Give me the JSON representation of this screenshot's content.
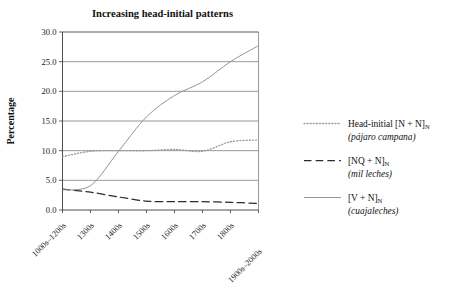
{
  "chart_data": {
    "type": "line",
    "title": "Increasing head-initial patterns",
    "xlabel": "",
    "ylabel": "Percentage",
    "categories": [
      "1000s–1200s",
      "1300s",
      "1400s",
      "1500s",
      "1600s",
      "1700s",
      "1800s",
      "1900s–2000s"
    ],
    "ylim": [
      0.0,
      30.0
    ],
    "ytick_values": [
      "0.0",
      "5.0",
      "10.0",
      "15.0",
      "20.0",
      "25.0",
      "30.0"
    ],
    "grid": "horizontal",
    "legend_position": "right",
    "series": [
      {
        "name": "Head-initial [N + N]N",
        "label_main": "Head-initial [N + N]",
        "label_sub_n": "N",
        "label_example": "(pájaro campana)",
        "style": "dotted",
        "color": "#9a9a9a",
        "values": [
          9.0,
          9.9,
          10.0,
          10.0,
          10.2,
          9.9,
          11.5,
          11.8
        ]
      },
      {
        "name": "[NQ + N]N",
        "label_main": "[NQ + N]",
        "label_sub_n": "N",
        "label_example": "(mil leches)",
        "style": "dashed",
        "color": "#2b2b2b",
        "values": [
          3.5,
          3.0,
          2.2,
          1.5,
          1.4,
          1.4,
          1.3,
          1.1
        ]
      },
      {
        "name": "[V + N]N",
        "label_main": "[V + N]",
        "label_sub_n": "N",
        "label_example": "(cuajaleches)",
        "style": "solid",
        "color": "#8e8e8e",
        "values": [
          3.4,
          4.1,
          9.9,
          15.7,
          19.3,
          21.6,
          25.0,
          27.7
        ]
      }
    ]
  },
  "colors": {
    "background": "#ffffff",
    "grid": "#6e6e6e",
    "axis": "#3a3a3a",
    "text": "#111111"
  }
}
